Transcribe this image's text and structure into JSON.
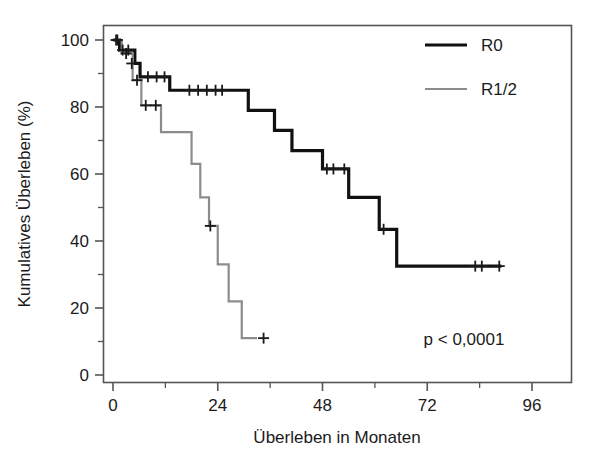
{
  "chart_data": {
    "type": "line",
    "subtype": "kaplan-meier-step",
    "title": "",
    "xlabel": "Überleben in Monaten",
    "ylabel": "Kumulatives Überleben (%)",
    "xlim": [
      -2,
      100
    ],
    "ylim": [
      -3,
      104
    ],
    "xticks": [
      0,
      24,
      48,
      72,
      96
    ],
    "xtick_labels": [
      "0",
      "24",
      "48",
      "72",
      "96"
    ],
    "xminor_ticks": [
      12,
      36,
      60,
      84
    ],
    "yticks": [
      0,
      20,
      40,
      60,
      80,
      100
    ],
    "ytick_labels": [
      "0",
      "20",
      "40",
      "60",
      "80",
      "100"
    ],
    "yminor_ticks": [
      10,
      30,
      50,
      70,
      90
    ],
    "grid": false,
    "legend_position": "top-right",
    "annotations": [
      {
        "name": "p-value",
        "text": "p < 0,0001",
        "x": 78,
        "y": 9
      }
    ],
    "series": [
      {
        "name": "R0",
        "color": "#111111",
        "line_width": 3.2,
        "steps": [
          {
            "x": 0,
            "y": 100
          },
          {
            "x": 1.5,
            "y": 100
          },
          {
            "x": 1.5,
            "y": 97
          },
          {
            "x": 5.0,
            "y": 97
          },
          {
            "x": 5.0,
            "y": 93
          },
          {
            "x": 6.2,
            "y": 93
          },
          {
            "x": 6.2,
            "y": 89
          },
          {
            "x": 13.0,
            "y": 89
          },
          {
            "x": 13.0,
            "y": 85
          },
          {
            "x": 31.0,
            "y": 85
          },
          {
            "x": 31.0,
            "y": 79
          },
          {
            "x": 37.0,
            "y": 79
          },
          {
            "x": 37.0,
            "y": 73
          },
          {
            "x": 41.0,
            "y": 73
          },
          {
            "x": 41.0,
            "y": 67
          },
          {
            "x": 48.0,
            "y": 67
          },
          {
            "x": 48.0,
            "y": 61.5
          },
          {
            "x": 54.0,
            "y": 61.5
          },
          {
            "x": 54.0,
            "y": 53
          },
          {
            "x": 61.0,
            "y": 53
          },
          {
            "x": 61.0,
            "y": 43.5
          },
          {
            "x": 65.0,
            "y": 43.5
          },
          {
            "x": 65.0,
            "y": 32.5
          },
          {
            "x": 89.0,
            "y": 32.5
          }
        ],
        "censored": [
          {
            "x": 0.7,
            "y": 100
          },
          {
            "x": 2.2,
            "y": 97
          },
          {
            "x": 3.5,
            "y": 97
          },
          {
            "x": 4.3,
            "y": 93
          },
          {
            "x": 8.0,
            "y": 89
          },
          {
            "x": 10.0,
            "y": 89
          },
          {
            "x": 11.8,
            "y": 89
          },
          {
            "x": 17.5,
            "y": 85
          },
          {
            "x": 19.5,
            "y": 85
          },
          {
            "x": 21.5,
            "y": 85
          },
          {
            "x": 23.5,
            "y": 85
          },
          {
            "x": 25.0,
            "y": 85
          },
          {
            "x": 49.0,
            "y": 61.5
          },
          {
            "x": 50.5,
            "y": 61.5
          },
          {
            "x": 53.0,
            "y": 61.5
          },
          {
            "x": 62.0,
            "y": 43.5
          },
          {
            "x": 83.0,
            "y": 32.5
          },
          {
            "x": 84.5,
            "y": 32.5
          },
          {
            "x": 88.5,
            "y": 32.5
          }
        ]
      },
      {
        "name": "R1/2",
        "color": "#8c8c8c",
        "line_width": 2.2,
        "steps": [
          {
            "x": 0,
            "y": 100
          },
          {
            "x": 2.0,
            "y": 100
          },
          {
            "x": 2.0,
            "y": 96
          },
          {
            "x": 4.5,
            "y": 96
          },
          {
            "x": 4.5,
            "y": 88
          },
          {
            "x": 6.5,
            "y": 88
          },
          {
            "x": 6.5,
            "y": 80.5
          },
          {
            "x": 11.0,
            "y": 80.5
          },
          {
            "x": 11.0,
            "y": 72.5
          },
          {
            "x": 18.0,
            "y": 72.5
          },
          {
            "x": 18.0,
            "y": 63
          },
          {
            "x": 20.0,
            "y": 63
          },
          {
            "x": 20.0,
            "y": 53
          },
          {
            "x": 22.0,
            "y": 53
          },
          {
            "x": 22.0,
            "y": 44.5
          },
          {
            "x": 24.0,
            "y": 44.5
          },
          {
            "x": 24.0,
            "y": 33
          },
          {
            "x": 26.5,
            "y": 33
          },
          {
            "x": 26.5,
            "y": 22
          },
          {
            "x": 29.5,
            "y": 22
          },
          {
            "x": 29.5,
            "y": 11
          },
          {
            "x": 33.0,
            "y": 11
          }
        ],
        "censored": [
          {
            "x": 1.0,
            "y": 100
          },
          {
            "x": 3.0,
            "y": 96
          },
          {
            "x": 5.5,
            "y": 88
          },
          {
            "x": 7.5,
            "y": 80.5
          },
          {
            "x": 9.8,
            "y": 80.5
          },
          {
            "x": 22.3,
            "y": 44.5
          },
          {
            "x": 34.5,
            "y": 11
          }
        ]
      }
    ]
  },
  "legend": {
    "entries": [
      {
        "label": "R0",
        "color": "#111111"
      },
      {
        "label": "R1/2",
        "color": "#8c8c8c"
      }
    ]
  },
  "axes": {
    "x_title": "Überleben in Monaten",
    "y_title": "Kumulatives Überleben (%)"
  },
  "statistics": {
    "p_value_text": "p < 0,0001"
  },
  "colors": {
    "r0": "#111111",
    "r12": "#8c8c8c",
    "frame": "#4d4d4d",
    "text": "#1b1b1b",
    "background": "#ffffff"
  }
}
